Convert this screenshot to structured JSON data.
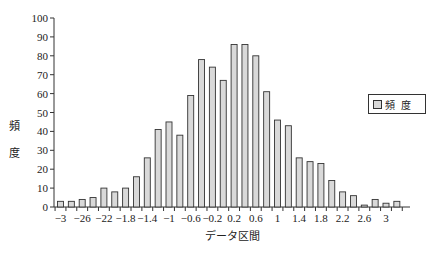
{
  "chart_data": {
    "type": "bar",
    "title": "",
    "xlabel": "データ区間",
    "ylabel": "頻度",
    "ylim": [
      0,
      100
    ],
    "yticks": [
      0,
      10,
      20,
      30,
      40,
      50,
      60,
      70,
      80,
      90,
      100
    ],
    "grid": false,
    "legend_position": "right",
    "categories": [
      -3.0,
      -2.8,
      -2.6,
      -2.4,
      -2.2,
      -2.0,
      -1.8,
      -1.6,
      -1.4,
      -1.2,
      -1.0,
      -0.8,
      -0.6,
      -0.4,
      -0.2,
      0.0,
      0.2,
      0.4,
      0.6,
      0.8,
      1.0,
      1.2,
      1.4,
      1.6,
      1.8,
      2.0,
      2.2,
      2.4,
      2.6,
      2.8,
      3.0,
      3.2
    ],
    "xtick_labels": [
      "-3",
      "",
      "-26",
      "",
      "-22",
      "",
      "-1.8",
      "",
      "-1.4",
      "",
      "-1",
      "",
      "-0.6",
      "",
      "-0.2",
      "",
      "0.2",
      "",
      "0.6",
      "",
      "1",
      "",
      "1.4",
      "",
      "1.8",
      "",
      "2.2",
      "",
      "2.6",
      "",
      "3",
      ""
    ],
    "series": [
      {
        "name": "頻 度",
        "color": "#d9d9d9",
        "values": [
          3,
          3,
          4,
          5,
          10,
          8,
          10,
          16,
          26,
          41,
          45,
          38,
          59,
          78,
          74,
          67,
          86,
          86,
          80,
          61,
          46,
          43,
          26,
          24,
          23,
          14,
          8,
          6,
          1,
          4,
          2,
          3
        ]
      }
    ]
  },
  "axis": {
    "y_title_line1": "頻",
    "y_title_line2": "度",
    "x_title": "データ区間"
  },
  "legend": {
    "label": "頻度"
  }
}
